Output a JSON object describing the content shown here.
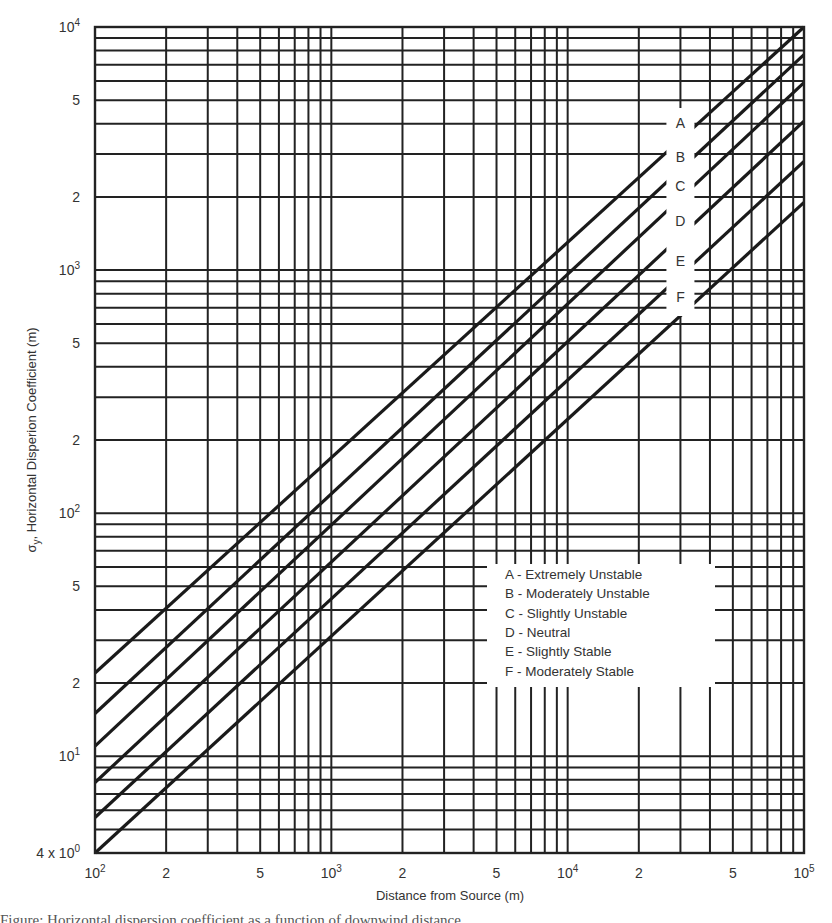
{
  "chart_data": {
    "type": "line",
    "title": "",
    "xlabel": "Distance from Source (m)",
    "ylabel": "σy, Horizontal Disperion Coefficient (m)",
    "xscale": "log",
    "yscale": "log",
    "xlim": [
      100,
      100000
    ],
    "ylim": [
      4,
      10000
    ],
    "grid": true,
    "x_ticks": [
      {
        "value": 100,
        "label": "10",
        "sup": "2"
      },
      {
        "value": 200,
        "label": "2",
        "sup": ""
      },
      {
        "value": 500,
        "label": "5",
        "sup": ""
      },
      {
        "value": 1000,
        "label": "10",
        "sup": "3"
      },
      {
        "value": 2000,
        "label": "2",
        "sup": ""
      },
      {
        "value": 5000,
        "label": "5",
        "sup": ""
      },
      {
        "value": 10000,
        "label": "10",
        "sup": "4"
      },
      {
        "value": 20000,
        "label": "2",
        "sup": ""
      },
      {
        "value": 50000,
        "label": "5",
        "sup": ""
      },
      {
        "value": 100000,
        "label": "10",
        "sup": "5"
      }
    ],
    "y_ticks": [
      {
        "value": 4,
        "label": "4 x 10",
        "sup": "0"
      },
      {
        "value": 10,
        "label": "10",
        "sup": "1"
      },
      {
        "value": 20,
        "label": "2",
        "sup": ""
      },
      {
        "value": 50,
        "label": "5",
        "sup": ""
      },
      {
        "value": 100,
        "label": "10",
        "sup": "2"
      },
      {
        "value": 200,
        "label": "2",
        "sup": ""
      },
      {
        "value": 500,
        "label": "5",
        "sup": ""
      },
      {
        "value": 1000,
        "label": "10",
        "sup": "3"
      },
      {
        "value": 2000,
        "label": "2",
        "sup": ""
      },
      {
        "value": 5000,
        "label": "5",
        "sup": ""
      },
      {
        "value": 10000,
        "label": "10",
        "sup": "4"
      }
    ],
    "x": [
      100,
      100000
    ],
    "series": [
      {
        "name": "A",
        "label": "A - Extremely Unstable",
        "values": [
          22,
          10000
        ]
      },
      {
        "name": "B",
        "label": "B - Moderately Unstable",
        "values": [
          15,
          7700
        ]
      },
      {
        "name": "C",
        "label": "C - Slightly Unstable",
        "values": [
          11,
          5900
        ]
      },
      {
        "name": "D",
        "label": "D - Neutral",
        "values": [
          7.8,
          4100
        ]
      },
      {
        "name": "E",
        "label": "E - Slightly Stable",
        "values": [
          5.6,
          2800
        ]
      },
      {
        "name": "F",
        "label": "F - Moderately Stable",
        "values": [
          4,
          1900
        ]
      }
    ],
    "legend_position": "lower right (inside plot)",
    "series_label_x": 30000
  },
  "caption_fragment": "Figure: Horizontal dispersion coefficient as a function of downwind distance"
}
